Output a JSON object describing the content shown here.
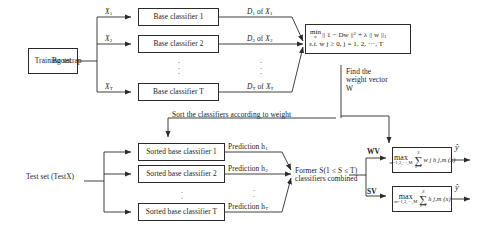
{
  "diagram": {
    "stroke_color": "#2b2b2b",
    "background": "#ffffff"
  },
  "train": {
    "training_set": "Training set",
    "bootstrap_label": "Bootstrap",
    "sample_labels": [
      "X1",
      "X2",
      "XT"
    ],
    "classifiers": [
      "Base classifier 1",
      "Base classifier 2",
      "Base classifier T"
    ],
    "outputs": [
      "D1 of X1",
      "D2 of X2",
      "DT of XT"
    ],
    "vertical_dots": "."
  },
  "optimization": {
    "objective_min": "min",
    "objective_var": "w",
    "objective_body": "|| 1 − Dw ||",
    "objective_power": "2",
    "objective_lambda": "+ λ || w ||",
    "objective_norm": "1",
    "constraint_prefix": "s.t.",
    "constraint_body": "w j ≥ 0, j = 1, 2, ···, T",
    "find_weight_text": "Find the weight vector W",
    "sort_text": "Sort the classifiers according to weight"
  },
  "test": {
    "test_set": "Test set (TestX)",
    "classifiers": [
      "Sorted base classifier 1",
      "Sorted base classifier 2",
      "Sorted base classifier T"
    ],
    "predictions": [
      "Prediction h1",
      "Prediction h2",
      "Prediction hT"
    ],
    "combine_line1": "Former S(1 ≤ S ≤ T)",
    "combine_line2": "classifiers combined"
  },
  "voting": {
    "wv_label": "WV",
    "sv_label": "SV",
    "wv": {
      "max": "max",
      "max_limits": "m=1,2,···,M",
      "sum_top": "S",
      "sum_bottom": "j=1",
      "term": "w j h j,m (x)"
    },
    "sv": {
      "max": "max",
      "max_limits": "m=1,2,···,M",
      "sum_top": "S",
      "sum_bottom": "j=1",
      "term": "h j,m (x)"
    },
    "output_label_wv": "ŷ",
    "output_label_sv": "ŷ"
  }
}
